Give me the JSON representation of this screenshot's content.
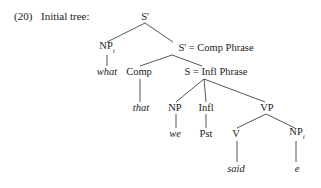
{
  "page": {
    "example_number": "(20)",
    "caption": "Initial tree:",
    "background_color": "#ffffff",
    "line_color": "#2a2a2a",
    "text_color": "#1a1a1a"
  },
  "tree": {
    "type": "syntax-tree",
    "sentence": "what that we Pst said e",
    "nodes": [
      {
        "id": "s-bar-root",
        "label": "S'",
        "subscript": "",
        "italic": false,
        "x": 145,
        "y": 17
      },
      {
        "id": "np-i-top",
        "label": "NP",
        "subscript": "i",
        "italic": false,
        "x": 107,
        "y": 48
      },
      {
        "id": "s-bar-comp",
        "label": "S' = Comp Phrase",
        "subscript": "",
        "italic": false,
        "x": 216,
        "y": 48
      },
      {
        "id": "what",
        "label": "what",
        "subscript": "",
        "italic": true,
        "x": 107,
        "y": 72
      },
      {
        "id": "comp",
        "label": "Comp",
        "subscript": "",
        "italic": false,
        "x": 139,
        "y": 72
      },
      {
        "id": "s-infl",
        "label": "S = Infl Phrase",
        "subscript": "",
        "italic": false,
        "x": 216,
        "y": 72
      },
      {
        "id": "that",
        "label": "that",
        "subscript": "",
        "italic": true,
        "x": 141,
        "y": 108
      },
      {
        "id": "np-subject",
        "label": "NP",
        "subscript": "",
        "italic": false,
        "x": 175,
        "y": 108
      },
      {
        "id": "infl",
        "label": "Infl",
        "subscript": "",
        "italic": false,
        "x": 206,
        "y": 108
      },
      {
        "id": "vp",
        "label": "VP",
        "subscript": "",
        "italic": false,
        "x": 267,
        "y": 108
      },
      {
        "id": "we",
        "label": "we",
        "subscript": "",
        "italic": true,
        "x": 175,
        "y": 134
      },
      {
        "id": "pst",
        "label": "Pst",
        "subscript": "",
        "italic": false,
        "x": 206,
        "y": 134
      },
      {
        "id": "v",
        "label": "V",
        "subscript": "",
        "italic": false,
        "x": 236,
        "y": 134
      },
      {
        "id": "np-i-trace",
        "label": "NP",
        "subscript": "i",
        "italic": false,
        "x": 297,
        "y": 134
      },
      {
        "id": "said",
        "label": "said",
        "subscript": "",
        "italic": true,
        "x": 236,
        "y": 169
      },
      {
        "id": "trace-e",
        "label": "e",
        "subscript": "",
        "italic": true,
        "x": 297,
        "y": 169
      }
    ],
    "edges": [
      {
        "id": "edge-root-np",
        "from": "s-bar-root",
        "to": "np-i-top",
        "x1": 145,
        "y1": 23,
        "x2": 107,
        "y2": 42
      },
      {
        "id": "edge-root-sbar",
        "from": "s-bar-root",
        "to": "s-bar-comp",
        "x1": 145,
        "y1": 23,
        "x2": 173,
        "y2": 42
      },
      {
        "id": "edge-np-what",
        "from": "np-i-top",
        "to": "what",
        "x1": 107,
        "y1": 55,
        "x2": 107,
        "y2": 66
      },
      {
        "id": "edge-sbar-comp",
        "from": "s-bar-comp",
        "to": "comp",
        "x1": 172,
        "y1": 55,
        "x2": 140,
        "y2": 66
      },
      {
        "id": "edge-sbar-s",
        "from": "s-bar-comp",
        "to": "s-infl",
        "x1": 172,
        "y1": 55,
        "x2": 202,
        "y2": 66
      },
      {
        "id": "edge-comp-that",
        "from": "comp",
        "to": "that",
        "x1": 140,
        "y1": 79,
        "x2": 140,
        "y2": 102
      },
      {
        "id": "edge-s-np",
        "from": "s-infl",
        "to": "np-subject",
        "x1": 204,
        "y1": 79,
        "x2": 176,
        "y2": 102
      },
      {
        "id": "edge-s-infl",
        "from": "s-infl",
        "to": "infl",
        "x1": 204,
        "y1": 79,
        "x2": 206,
        "y2": 102
      },
      {
        "id": "edge-s-vp",
        "from": "s-infl",
        "to": "vp",
        "x1": 204,
        "y1": 79,
        "x2": 265,
        "y2": 102
      },
      {
        "id": "edge-np-we",
        "from": "np-subject",
        "to": "we",
        "x1": 176,
        "y1": 114,
        "x2": 176,
        "y2": 128
      },
      {
        "id": "edge-infl-pst",
        "from": "infl",
        "to": "pst",
        "x1": 206,
        "y1": 114,
        "x2": 206,
        "y2": 128
      },
      {
        "id": "edge-vp-v",
        "from": "vp",
        "to": "v",
        "x1": 266,
        "y1": 114,
        "x2": 237,
        "y2": 128
      },
      {
        "id": "edge-vp-np",
        "from": "vp",
        "to": "np-i-trace",
        "x1": 266,
        "y1": 114,
        "x2": 295,
        "y2": 128
      },
      {
        "id": "edge-v-said",
        "from": "v",
        "to": "said",
        "x1": 237,
        "y1": 141,
        "x2": 237,
        "y2": 162
      },
      {
        "id": "edge-np-e",
        "from": "np-i-trace",
        "to": "trace-e",
        "x1": 296,
        "y1": 141,
        "x2": 296,
        "y2": 162
      }
    ]
  }
}
